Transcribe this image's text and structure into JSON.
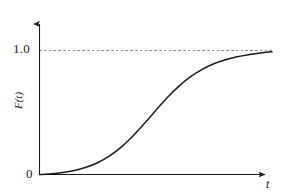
{
  "figure": {
    "background_color": "#ffffff",
    "axis_color": "#1a1a1a",
    "curve_color": "#1a1a1a",
    "asymptote_color": "#8c8c8c"
  },
  "labels": {
    "y_tick_1": "1.0",
    "origin": "0",
    "x_axis": "t",
    "y_axis": "F(t)"
  },
  "chart_data": {
    "type": "line",
    "title": "",
    "xlabel": "t",
    "ylabel": "F(t)",
    "xlim": [
      0,
      1
    ],
    "ylim": [
      0,
      1.05
    ],
    "grid": false,
    "legend": null,
    "xticks": [],
    "xtick_labels": [],
    "yticks": [
      0,
      1.0
    ],
    "ytick_labels": [
      "0",
      "1.0"
    ],
    "annotations": [
      {
        "type": "asymptote",
        "orientation": "horizontal",
        "value": 1.0,
        "style": "dashed",
        "color": "#8c8c8c"
      }
    ],
    "series": [
      {
        "name": "F(t)",
        "description": "cumulative distribution function, sigmoid S-shape rising from 0 to 1",
        "x": [
          0.0,
          0.05,
          0.1,
          0.15,
          0.2,
          0.25,
          0.3,
          0.35,
          0.4,
          0.45,
          0.5,
          0.55,
          0.6,
          0.65,
          0.7,
          0.75,
          0.8,
          0.85,
          0.9,
          0.95,
          1.0
        ],
        "values": [
          0.0,
          0.006,
          0.016,
          0.032,
          0.058,
          0.095,
          0.148,
          0.219,
          0.307,
          0.409,
          0.517,
          0.621,
          0.713,
          0.789,
          0.848,
          0.893,
          0.925,
          0.949,
          0.966,
          0.979,
          0.99
        ]
      }
    ]
  }
}
